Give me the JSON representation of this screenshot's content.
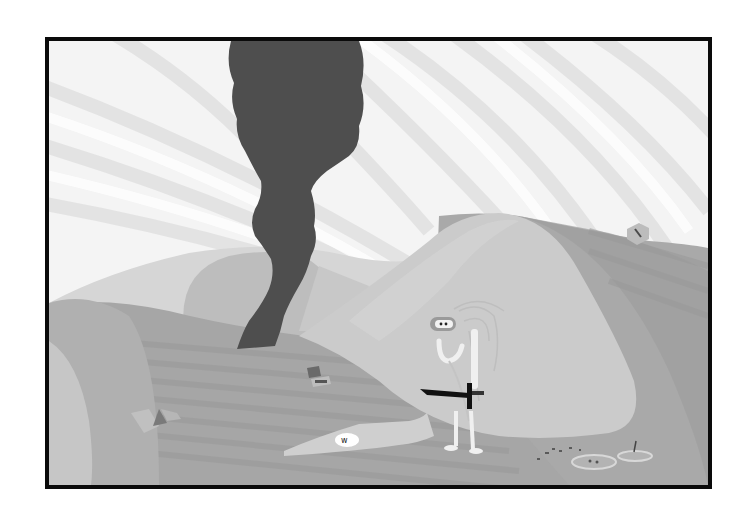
{
  "scene": {
    "title": "Desert dunes with smoke column",
    "palette": {
      "sky": "#f4f4f4",
      "sky_streak": "#e2e2e2",
      "far_dune": "#d6d6d6",
      "far_dune_shadow": "#bdbdbd",
      "mid_ground": "#a6a6a6",
      "mid_ground_dark": "#989898",
      "ground_stripe": "#9c9c9c",
      "right_hill": "#a9a9a9",
      "big_dune": "#cbcbcb",
      "big_dune_edge": "#d6d6d6",
      "left_curve_outer": "#b0b0b0",
      "left_curve_inner": "#c6c6c6",
      "smoke": "#4e4e4e",
      "border": "#0a0a0a"
    },
    "objects": [
      {
        "name": "smoke-column",
        "label": "Dark smoke column rising from behind dunes"
      },
      {
        "name": "hero-character",
        "label": "Hooded white stick-figure holding a black sword"
      },
      {
        "name": "sword",
        "label": "Black sword"
      },
      {
        "name": "rock-top-right",
        "label": "Small pentagon rock on the hill"
      },
      {
        "name": "rock-left",
        "label": "Broken triangular stones"
      },
      {
        "name": "debris-center",
        "label": "Small dark debris pieces"
      },
      {
        "name": "white-patch",
        "label": "Light patch with dark marking on ground"
      },
      {
        "name": "puddle-left",
        "label": "Shallow puddle"
      },
      {
        "name": "puddle-right",
        "label": "Shallow puddle with stick"
      }
    ]
  }
}
